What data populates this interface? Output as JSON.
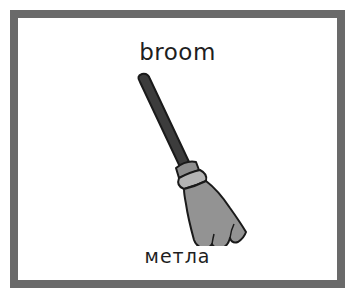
{
  "card": {
    "word_english": "broom",
    "word_russian": "метла",
    "illustration": "broom-icon",
    "colors": {
      "border": "#6a6a6a",
      "background": "#ffffff",
      "handle": "#3c3c3c",
      "ferrule": "#a8a8a8",
      "bristles": "#939393",
      "outline": "#1a1a1a",
      "text": "#1e1e1e"
    }
  }
}
